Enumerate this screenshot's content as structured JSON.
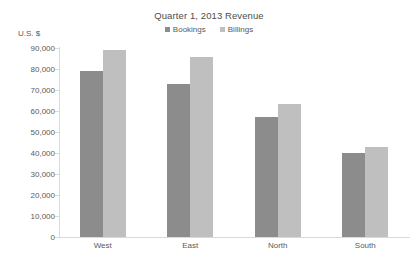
{
  "chart_data": {
    "type": "bar",
    "title": "Quarter 1, 2013 Revenue",
    "xlabel": "",
    "ylabel": "U.S. $",
    "categories": [
      "West",
      "East",
      "North",
      "South"
    ],
    "series": [
      {
        "name": "Bookings",
        "color": "#8c8c8c",
        "values": [
          79000,
          73000,
          57000,
          40000
        ]
      },
      {
        "name": "Billings",
        "color": "#bfbfbf",
        "values": [
          89000,
          85500,
          63500,
          43000
        ]
      }
    ],
    "ylim": [
      0,
      90000
    ],
    "ytick_values": [
      0,
      10000,
      20000,
      30000,
      40000,
      50000,
      60000,
      70000,
      80000,
      90000
    ],
    "ytick_labels": [
      "0",
      "10,000",
      "20,000",
      "30,000",
      "40,000",
      "50,000",
      "60,000",
      "70,000",
      "80,000",
      "90,000"
    ],
    "grid": false,
    "legend_position": "top-center"
  }
}
